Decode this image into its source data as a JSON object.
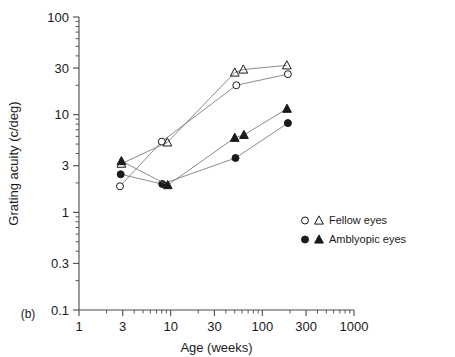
{
  "panel": {
    "label": "(b)"
  },
  "chart_data": {
    "type": "scatter",
    "title": "",
    "xlabel": "Age (weeks)",
    "ylabel": "Grating acuity (c/deg)",
    "xscale": "log",
    "yscale": "log",
    "xlim": [
      1,
      1000
    ],
    "ylim": [
      0.1,
      100
    ],
    "grid": false,
    "xticks": [
      1,
      3,
      10,
      30,
      100,
      300,
      1000
    ],
    "xticklabels": [
      "1",
      "3",
      "10",
      "30",
      "100",
      "300",
      "1000"
    ],
    "yticks": [
      0.1,
      0.3,
      1,
      3,
      10,
      30,
      100
    ],
    "yticklabels": [
      "0.1",
      "0.3",
      "1",
      "3",
      "10",
      "30",
      "100"
    ],
    "legend_position": "right-middle",
    "legend": [
      {
        "label": "Fellow eyes",
        "markers": [
          "open-circle",
          "open-triangle"
        ],
        "fill": "none",
        "edge": "#1a1a1a"
      },
      {
        "label": "Amblyopic eyes",
        "markers": [
          "filled-circle",
          "filled-triangle"
        ],
        "fill": "#1a1a1a",
        "edge": "#1a1a1a"
      }
    ],
    "series": [
      {
        "name": "Fellow eyes (subject 1)",
        "marker": "open-circle",
        "fill": "none",
        "edge": "#1a1a1a",
        "connected": true,
        "points": [
          {
            "x": 2.8,
            "y": 1.85
          },
          {
            "x": 8.0,
            "y": 5.3
          },
          {
            "x": 52,
            "y": 20
          },
          {
            "x": 190,
            "y": 26
          }
        ]
      },
      {
        "name": "Fellow eyes (subject 2)",
        "marker": "open-triangle",
        "fill": "none",
        "edge": "#1a1a1a",
        "connected": true,
        "points": [
          {
            "x": 2.9,
            "y": 3.15
          },
          {
            "x": 9.2,
            "y": 5.2
          },
          {
            "x": 50,
            "y": 27
          },
          {
            "x": 62,
            "y": 29
          },
          {
            "x": 185,
            "y": 32
          }
        ]
      },
      {
        "name": "Amblyopic eyes (subject 1)",
        "marker": "filled-circle",
        "fill": "#1a1a1a",
        "edge": "#1a1a1a",
        "connected": true,
        "points": [
          {
            "x": 2.85,
            "y": 2.45
          },
          {
            "x": 8.1,
            "y": 1.95
          },
          {
            "x": 51,
            "y": 3.6
          },
          {
            "x": 190,
            "y": 8.2
          }
        ]
      },
      {
        "name": "Amblyopic eyes (subject 2)",
        "marker": "filled-triangle",
        "fill": "#1a1a1a",
        "edge": "#1a1a1a",
        "connected": true,
        "points": [
          {
            "x": 2.9,
            "y": 3.35
          },
          {
            "x": 9.3,
            "y": 1.9
          },
          {
            "x": 50,
            "y": 5.8
          },
          {
            "x": 63,
            "y": 6.2
          },
          {
            "x": 186,
            "y": 11.5
          }
        ]
      }
    ]
  }
}
